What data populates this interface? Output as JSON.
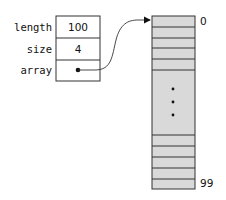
{
  "diagram": {
    "struct": {
      "fields": [
        {
          "name": "length",
          "value": "100"
        },
        {
          "name": "size",
          "value": "4"
        },
        {
          "name": "array",
          "value": "pointer"
        }
      ]
    },
    "array": {
      "first_index": "0",
      "last_index": "99",
      "ellipsis": "⋮",
      "fill_color": "#d9d9d9",
      "top_rows": 6,
      "bottom_rows": 5
    },
    "pointer": {
      "from": "array",
      "to": "array element 0"
    }
  }
}
